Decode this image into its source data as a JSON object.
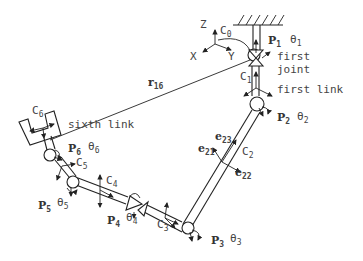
{
  "diagram": {
    "frame": {
      "origin": "C0",
      "axes": {
        "z": "Z",
        "x": "X",
        "y": "Y"
      }
    },
    "labels": {
      "c0": "C",
      "c0_sub": "0",
      "p1": "P",
      "p1_sub": "1",
      "theta1": "θ",
      "theta1_sub": "1",
      "first_joint_1": "first",
      "first_joint_2": "joint",
      "c1": "C",
      "c1_sub": "1",
      "first_link": "first link",
      "p2": "P",
      "p2_sub": "2",
      "theta2": "θ",
      "theta2_sub": "2",
      "r16": "r",
      "r16_sub": "16",
      "e23": "e",
      "e23_sub": "23",
      "e21": "e",
      "e21_sub": "21",
      "c2": "C",
      "c2_sub": "2",
      "e22": "e",
      "e22_sub": "22",
      "c6": "C",
      "c6_sub": "6",
      "sixth_link": "sixth link",
      "p6": "P",
      "p6_sub": "6",
      "theta6": "θ",
      "theta6_sub": "6",
      "c5": "C",
      "c5_sub": "5",
      "c4": "C",
      "c4_sub": "4",
      "p5": "P",
      "p5_sub": "5",
      "theta5": "θ",
      "theta5_sub": "5",
      "p4": "P",
      "p4_sub": "4",
      "theta4": "θ",
      "theta4_sub": "4",
      "c3": "C",
      "c3_sub": "3",
      "p3": "P",
      "p3_sub": "3",
      "theta3": "θ",
      "theta3_sub": "3"
    }
  }
}
